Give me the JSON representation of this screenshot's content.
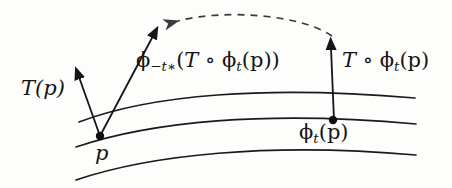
{
  "figure": {
    "background_color": "#fdfdfc",
    "ink_color": "#151515",
    "width": 452,
    "height": 188
  },
  "labels": {
    "tangent_at_p": {
      "text": "T(p)",
      "x": 21,
      "y": 78
    },
    "pushforward": {
      "phi_head": "ϕ",
      "phi_sub": "−t∗",
      "open": "(",
      "T": "T",
      "compose": "∘",
      "phi2_head": "ϕ",
      "phi2_sub": "t",
      "arg": "(p)",
      "close": ")",
      "plain": "ϕ−t∗(T ∘ ϕt(p))",
      "x": 136,
      "y": 50
    },
    "transported": {
      "T": "T",
      "compose": "∘",
      "phi_head": "ϕ",
      "phi_sub": "t",
      "arg": "(p)",
      "plain": "T ∘ ϕt(p)",
      "x": 342,
      "y": 50
    },
    "flowed_point": {
      "phi_head": "ϕ",
      "phi_sub": "t",
      "arg": "(p)",
      "plain": "ϕt(p)",
      "x": 299,
      "y": 122
    },
    "base_point": {
      "text": "p",
      "x": 95,
      "y": 143
    }
  },
  "points": [
    {
      "name": "p",
      "x": 100,
      "y": 136,
      "radius": 4
    },
    {
      "name": "phi_t_p",
      "x": 333,
      "y": 120,
      "radius": 4
    }
  ],
  "curves": [
    {
      "name": "upper-flow-line",
      "d": "M 79 122 C 150 95, 265 85, 415 98"
    },
    {
      "name": "middle-flow-line",
      "d": "M 76 147 C 150 122, 265 110, 416 124"
    },
    {
      "name": "lower-flow-line",
      "d": "M 76 180 C 150 155, 268 142, 416 155"
    }
  ],
  "vectors": [
    {
      "name": "T-of-p-vector",
      "from_x": 100,
      "from_y": 136,
      "to_x": 77,
      "to_y": 71,
      "style": "solid"
    },
    {
      "name": "pushforward-vector",
      "from_x": 100,
      "from_y": 136,
      "to_x": 156,
      "to_y": 30,
      "style": "solid"
    },
    {
      "name": "transported-vector",
      "from_x": 334,
      "from_y": 120,
      "to_x": 331,
      "to_y": 41,
      "style": "solid"
    }
  ],
  "dashed_arc": {
    "name": "pushforward-transport-arc",
    "from_x": 332,
    "from_y": 36,
    "to_x": 172,
    "to_y": 23,
    "direction": "right-to-left",
    "style": "dashed",
    "dash_pattern": "7 6"
  }
}
